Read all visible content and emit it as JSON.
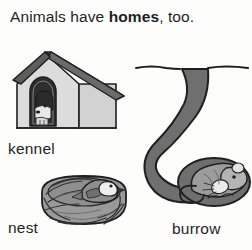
{
  "page": {
    "background_color": "#fdfdfb",
    "text_color": "#1f1f1f"
  },
  "title": {
    "before": "Animals have ",
    "emphasis": "homes",
    "after": ", too."
  },
  "palette": {
    "ink": "#1f1f1f",
    "roof_dark_gray": "#5d5d5d",
    "wall_light_gray": "#dcdcdc",
    "wall_shadow_gray": "#c4c4c4",
    "doorway_dark": "#2e2e2e",
    "animal_gray": "#808080",
    "animal_light": "#e8e8e8",
    "nest_gray": "#9a9a9a",
    "nest_dark": "#3a3a3a",
    "burrow_gray": "#6f6f6f"
  },
  "figures": [
    {
      "id": "kennel",
      "label": "kennel",
      "icon": "dog-house-icon",
      "animal": "dog",
      "description": "Gabled dog house with dark roof, light walls and an arched doorway with a dog looking out"
    },
    {
      "id": "nest",
      "label": "nest",
      "icon": "bird-nest-icon",
      "animal": "bird",
      "description": "Woven twig nest bowl with a small bird sitting inside"
    },
    {
      "id": "burrow",
      "label": "burrow",
      "icon": "burrow-tunnel-icon",
      "animal": "rodent",
      "description": "S-curved underground tunnel leading from the ground surface down to a curled sleeping rodent"
    }
  ]
}
